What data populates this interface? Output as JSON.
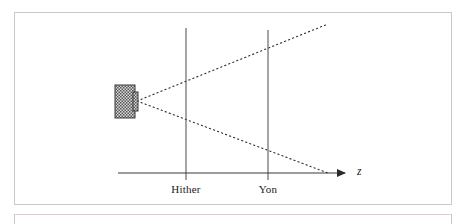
{
  "figure": {
    "background_color": "#ffffff",
    "frame_color": "#c9c9c9",
    "next_frame_top_color": "#f0c6cb"
  },
  "diagram": {
    "type": "view-frustum-schematic",
    "axis": {
      "name": "z-axis",
      "label": "z",
      "label_style": "italic",
      "color": "#3a3a3a",
      "x_start": 118,
      "x_end": 352,
      "y": 173,
      "arrowhead": "solid-triangle-right",
      "label_x": 358,
      "label_y": 167
    },
    "camera": {
      "name": "camera-body",
      "fill_pattern": "checkerboard-hatch",
      "pattern_color": "#555555",
      "pattern_background": "#d8d8d8",
      "outline_color": "#3a3a3a",
      "x": 115,
      "y": 85,
      "width": 20,
      "height": 33,
      "lens": {
        "name": "camera-lens",
        "x": 133,
        "y": 92,
        "width": 5,
        "height": 19
      }
    },
    "apex": {
      "x": 137,
      "y": 101
    },
    "frustum_lines": [
      {
        "name": "upper-frustum-ray",
        "style": "dotted",
        "color": "#2a2a2a",
        "x1": 137,
        "y1": 101,
        "x2": 328,
        "y2": 24
      },
      {
        "name": "lower-frustum-ray",
        "style": "dotted",
        "color": "#2a2a2a",
        "x1": 137,
        "y1": 101,
        "x2": 328,
        "y2": 173
      }
    ],
    "planes": [
      {
        "name": "hither-plane",
        "label": "Hither",
        "color": "#5a5a5a",
        "x": 186,
        "y_top": 28,
        "y_bottom": 180,
        "label_x": 186,
        "label_y": 183
      },
      {
        "name": "yon-plane",
        "label": "Yon",
        "color": "#5a5a5a",
        "x": 268,
        "y_top": 30,
        "y_bottom": 180,
        "label_x": 268,
        "label_y": 183
      }
    ]
  }
}
